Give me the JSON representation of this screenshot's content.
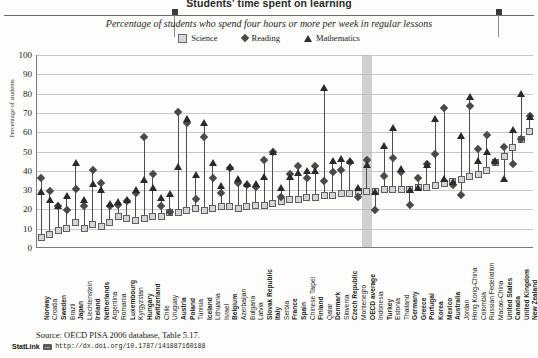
{
  "header": {
    "title": "Students' time spent on learning",
    "subtitle": "Percentage of students who spend four hours or more per week in regular lessons"
  },
  "legend": [
    {
      "label": "Science",
      "marker": "square-icon",
      "color": "#d4d4d4"
    },
    {
      "label": "Reading",
      "marker": "diamond-icon",
      "color": "#4a4a4a"
    },
    {
      "label": "Mathematics",
      "marker": "triangle-icon",
      "color": "#2a2a2a"
    }
  ],
  "footer": {
    "source": "Source: OECD PISA 2006 database, Table 5.17.",
    "statlink_label": "StatLink",
    "statlink_badge": "···",
    "statlink_url": "http://dx.doi.org/10.1787/141887160188"
  },
  "chart_data": {
    "type": "scatter",
    "title": "Students' time spent on learning",
    "subtitle": "Percentage of students who spend four hours or more per week in regular lessons",
    "xlabel": "",
    "ylabel": "Percentage of students",
    "ylim": [
      0,
      100
    ],
    "yticks": [
      0,
      10,
      20,
      30,
      40,
      50,
      60,
      70,
      80,
      90,
      100
    ],
    "grid": true,
    "legend_position": "top-center",
    "highlight_category": "OECD average",
    "highlight_color": "#b9b9b9",
    "categories": [
      "Norway",
      "Croatia",
      "Sweden",
      "Brazil",
      "Japan",
      "Liechtenstein",
      "Ireland",
      "Netherlands",
      "Argentina",
      "Romania",
      "Luxembourg",
      "Kyrgyzstan",
      "Hungary",
      "Switzerland",
      "Chile",
      "Uruguay",
      "Austria",
      "Poland",
      "Tunisia",
      "Iceland",
      "Lithuania",
      "Israel",
      "Belgium",
      "Azerbaijan",
      "Bulgaria",
      "Latvia",
      "Slovak Republic",
      "Italy",
      "Serbia",
      "France",
      "Spain",
      "Chinese Taipei",
      "Finland",
      "Qatar",
      "Denmark",
      "Slovenia",
      "Czech Republic",
      "Montenegro",
      "OECD average",
      "Indonesia",
      "Turkey",
      "Estonia",
      "Thailand",
      "Germany",
      "Greece",
      "Portugal",
      "Korea",
      "Mexico",
      "Australia",
      "Jordan",
      "Hong Kong-China",
      "Colombia",
      "Russian Federation",
      "Macao-China",
      "United States",
      "Canada",
      "United Kingdom",
      "New Zealand"
    ],
    "bold_categories": [
      "Norway",
      "Sweden",
      "Japan",
      "Ireland",
      "Netherlands",
      "Luxembourg",
      "Hungary",
      "Switzerland",
      "Austria",
      "Poland",
      "Iceland",
      "Belgium",
      "Slovak Republic",
      "Italy",
      "France",
      "Spain",
      "Finland",
      "Denmark",
      "Czech Republic",
      "OECD average",
      "Turkey",
      "Germany",
      "Greece",
      "Portugal",
      "Korea",
      "Mexico",
      "Australia",
      "United States",
      "Canada",
      "United Kingdom",
      "New Zealand"
    ],
    "series": [
      {
        "name": "Science",
        "marker": "square",
        "values": [
          5,
          7,
          9,
          10,
          13,
          10,
          12,
          11,
          13,
          16,
          15,
          14,
          15,
          16,
          16,
          18,
          18,
          19,
          20,
          19,
          20,
          21,
          21,
          20,
          21,
          22,
          22,
          23,
          24,
          25,
          25,
          26,
          26,
          27,
          27,
          28,
          28,
          29,
          29,
          29,
          30,
          30,
          30,
          30,
          31,
          31,
          32,
          33,
          34,
          35,
          37,
          38,
          40,
          44,
          47,
          52,
          56,
          60
        ]
      },
      {
        "name": "Reading",
        "marker": "diamond",
        "values": [
          36,
          29,
          21,
          19,
          30,
          21,
          40,
          33,
          21,
          22,
          24,
          28,
          57,
          38,
          21,
          18,
          70,
          64,
          25,
          57,
          36,
          28,
          41,
          33,
          32,
          31,
          45,
          49,
          26,
          38,
          42,
          36,
          42,
          34,
          39,
          40,
          44,
          26,
          45,
          19,
          37,
          46,
          39,
          22,
          36,
          43,
          48,
          72,
          32,
          27,
          73,
          51,
          58,
          44,
          52,
          43,
          56,
          68
        ]
      },
      {
        "name": "Mathematics",
        "marker": "triangle",
        "values": [
          29,
          25,
          22,
          27,
          44,
          25,
          33,
          30,
          23,
          24,
          25,
          30,
          35,
          31,
          26,
          28,
          42,
          67,
          38,
          65,
          44,
          32,
          42,
          36,
          33,
          33,
          37,
          50,
          31,
          37,
          39,
          40,
          40,
          83,
          45,
          46,
          45,
          31,
          43,
          29,
          53,
          62,
          41,
          30,
          31,
          43,
          67,
          36,
          34,
          58,
          78,
          45,
          50,
          45,
          36,
          61,
          80,
          68
        ]
      }
    ]
  }
}
